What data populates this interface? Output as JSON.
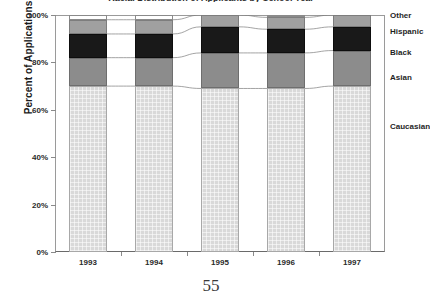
{
  "page": {
    "number": "55"
  },
  "chart_data": {
    "type": "bar",
    "subtype": "stacked-100-percent",
    "title": "Racial Distribution of Applicants by School Year",
    "xlabel": "",
    "ylabel": "Percent of Applications",
    "ylim": [
      0,
      100
    ],
    "ytick_labels": [
      "0%",
      "20%",
      "40%",
      "60%",
      "80%",
      "100%"
    ],
    "ytick_values": [
      0,
      20,
      40,
      60,
      80,
      100
    ],
    "grid": false,
    "legend_position": "right",
    "categories": [
      "1993",
      "1994",
      "1995",
      "1996",
      "1997"
    ],
    "series": [
      {
        "name": "Caucasian",
        "color": "#d9d9d9",
        "values": [
          70,
          70,
          69,
          69,
          70
        ]
      },
      {
        "name": "Asian",
        "color": "#8c8c8c",
        "values": [
          12,
          12,
          15,
          15,
          15
        ]
      },
      {
        "name": "Black",
        "color": "#191919",
        "values": [
          10,
          10,
          11,
          10,
          10
        ]
      },
      {
        "name": "Hispanic",
        "color": "#a0a0a0",
        "values": [
          6,
          6,
          5,
          5,
          5
        ]
      },
      {
        "name": "Other",
        "color": "#ffffff",
        "values": [
          2,
          2,
          0,
          1,
          0
        ]
      }
    ],
    "legend_entries": [
      "Other",
      "Hispanic",
      "Black",
      "Asian",
      "Caucasian"
    ]
  }
}
